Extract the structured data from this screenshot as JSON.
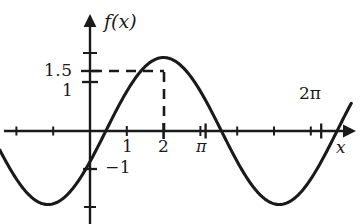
{
  "figure": {
    "kind": "cartesian-plot",
    "background_color": "#ffffff",
    "ink_color": "#1a1a1a",
    "width": 362,
    "height": 224
  },
  "axes": {
    "y_axis_label": "f(x)",
    "x_axis_label": "x",
    "origin_px": {
      "x": 90,
      "y": 131
    },
    "x_unit_px": 36.8,
    "y_unit_px": 49,
    "x_ticks": [
      {
        "value": 1,
        "label": "1",
        "major": false
      },
      {
        "value": 2,
        "label": "2",
        "major": true
      },
      {
        "value": 3,
        "label": "",
        "major": false
      },
      {
        "value": 3.1416,
        "label": "π",
        "major": true
      },
      {
        "value": 4,
        "label": "",
        "major": false
      },
      {
        "value": 5,
        "label": "",
        "major": false
      },
      {
        "value": 6,
        "label": "",
        "major": false
      },
      {
        "value": 6.2832,
        "label": "2π",
        "major": true
      },
      {
        "value": -1,
        "label": "",
        "major": false
      },
      {
        "value": -2,
        "label": "",
        "major": false
      }
    ],
    "y_ticks": [
      {
        "value": 2,
        "label": "",
        "major": false
      },
      {
        "value": 1.5,
        "label": "1.5",
        "major": true
      },
      {
        "value": 1,
        "label": "1",
        "major": true
      },
      {
        "value": -1,
        "label": "−1",
        "major": true
      },
      {
        "value": -1.75,
        "label": "",
        "major": false
      }
    ],
    "grid": false,
    "arrows": {
      "x_positive": true,
      "y_positive": true
    }
  },
  "annotations": {
    "peak_point": {
      "x": 2,
      "y": 1.5
    },
    "dashed_horizontal": {
      "from_x": 0,
      "to_x": 2,
      "at_y": 1.5
    },
    "dashed_vertical": {
      "at_x": 2,
      "from_y": 0,
      "to_y": 1.5
    }
  },
  "chart_data": {
    "type": "line",
    "title": "",
    "xlabel": "x",
    "ylabel": "f(x)",
    "xlim": [
      -2.45,
      7.1
    ],
    "ylim": [
      -2.7,
      1.9
    ],
    "grid": false,
    "legend": null,
    "series": [
      {
        "name": "f(x) = 1.5 sin(x − 0.43)",
        "amplitude": 1.5,
        "period": 6.2832,
        "phase_shift": 0.43,
        "x": [
          -2.45,
          -2.2,
          -1.9,
          -1.6,
          -1.3,
          -1.0,
          -0.7,
          -0.43,
          -0.2,
          0.0,
          0.43,
          0.8,
          1.2,
          1.6,
          2.0,
          2.4,
          2.8,
          3.2,
          3.57,
          3.9,
          4.3,
          4.7,
          5.14,
          5.5,
          5.9,
          6.3,
          6.7,
          7.1
        ],
        "y": [
          -1.23,
          -1.41,
          -1.5,
          -1.47,
          -1.34,
          -1.12,
          -0.81,
          -0.6,
          -0.42,
          -0.21,
          0.0,
          0.55,
          1.02,
          1.35,
          1.5,
          1.45,
          1.22,
          0.84,
          0.0,
          -0.36,
          -0.84,
          -1.2,
          -1.5,
          -1.47,
          -1.27,
          -0.92,
          -0.49,
          -0.02
        ]
      }
    ],
    "annotated_points": [
      {
        "x": 2,
        "y": 1.5,
        "label": "1.5",
        "marker": "dashed-guides"
      }
    ],
    "x_tick_values": [
      1,
      2,
      3.1416,
      6.2832
    ],
    "x_tick_labels": [
      "1",
      "2",
      "π",
      "2π"
    ],
    "y_tick_values": [
      1.5,
      1,
      -1
    ],
    "y_tick_labels": [
      "1.5",
      "1",
      "−1"
    ]
  }
}
